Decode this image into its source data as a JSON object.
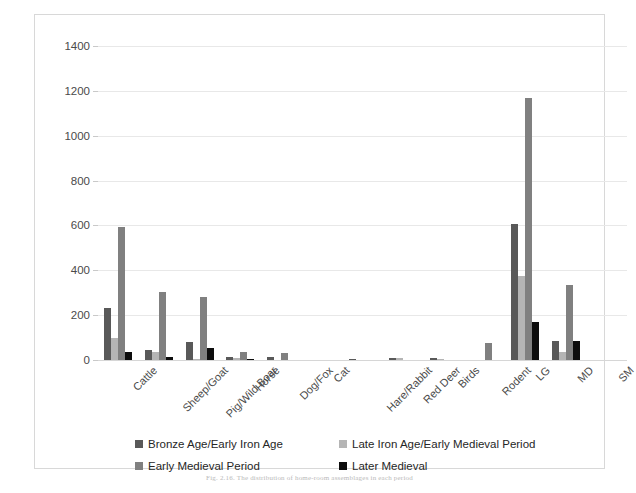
{
  "chart_data": {
    "type": "bar",
    "title": "",
    "xlabel": "",
    "ylabel": "",
    "ylim": [
      0,
      1400
    ],
    "ytick_values": [
      0,
      200,
      400,
      600,
      800,
      1000,
      1200,
      1400
    ],
    "ytick_labels": [
      "0",
      "200",
      "400",
      "600",
      "800",
      "1000",
      "1200",
      "1400"
    ],
    "grid": true,
    "legend_position": "bottom",
    "categories": [
      "Cattle",
      "Sheep/Goat",
      "Pig/Wild Boar",
      "Horse",
      "Dog/Fox",
      "Cat",
      "Hare/Rabbit",
      "Red Deer",
      "Birds",
      "Rodent",
      "LG",
      "MD",
      "SM"
    ],
    "series": [
      {
        "name": "Bronze Age/Early Iron Age",
        "color": "#595959",
        "values": [
          230,
          45,
          80,
          15,
          12,
          0,
          5,
          10,
          8,
          0,
          605,
          85,
          0
        ]
      },
      {
        "name": "Late Iron Age/Early Medieval Period",
        "color": "#b5b5b5",
        "values": [
          100,
          35,
          5,
          10,
          0,
          0,
          0,
          8,
          5,
          0,
          375,
          35,
          0
        ]
      },
      {
        "name": "Early Medieval Period",
        "color": "#808080",
        "values": [
          595,
          305,
          280,
          35,
          30,
          0,
          0,
          0,
          0,
          75,
          1168,
          335,
          0
        ]
      },
      {
        "name": "Later Medieval",
        "color": "#0d0d0d",
        "values": [
          35,
          15,
          55,
          3,
          0,
          0,
          0,
          0,
          0,
          0,
          170,
          85,
          0
        ]
      }
    ]
  },
  "caption": "Fig. 2.16. The distribution of home-room assemblages in each period",
  "colors": {
    "series_0": "#595959",
    "series_1": "#b5b5b5",
    "series_2": "#808080",
    "series_3": "#0d0d0d",
    "gridline": "#e8e8e8",
    "frame_border": "#d8d8d8",
    "tick_text": "#4a4a4a"
  }
}
